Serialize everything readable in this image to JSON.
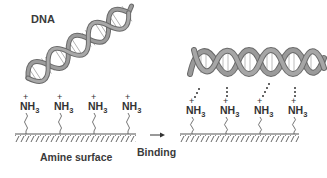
{
  "diagram": {
    "title_label": "DNA",
    "surface_label": "Amine surface",
    "process_label": "Binding",
    "group_label": {
      "charge": "+",
      "main": "NH",
      "subscript": "3"
    },
    "left_panel": {
      "state": "before binding",
      "amine_groups": [
        {
          "x": 20,
          "y": 100
        },
        {
          "x": 54,
          "y": 100
        },
        {
          "x": 88,
          "y": 100
        },
        {
          "x": 122,
          "y": 100
        }
      ]
    },
    "right_panel": {
      "state": "after binding",
      "amine_groups": [
        {
          "x": 188,
          "y": 104
        },
        {
          "x": 222,
          "y": 104
        },
        {
          "x": 256,
          "y": 104
        },
        {
          "x": 290,
          "y": 104
        }
      ]
    },
    "colors": {
      "helix_fill": "#8a8a8a",
      "helix_edge": "#5a5a5a",
      "text": "#333333",
      "surface": "#555555"
    }
  }
}
